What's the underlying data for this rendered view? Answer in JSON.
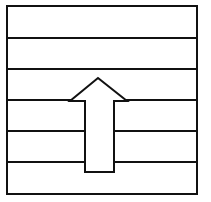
{
  "diagram": {
    "colors": {
      "stroke": "#111111",
      "fill": "#ffffff",
      "background": "#ffffff"
    },
    "frame": {
      "x": 7,
      "y": 6,
      "width": 190,
      "height": 188
    },
    "bands": [
      {
        "index": 1,
        "y_top": 6,
        "y_bottom": 38
      },
      {
        "index": 2,
        "y_top": 38,
        "y_bottom": 69
      },
      {
        "index": 3,
        "y_top": 69,
        "y_bottom": 100
      },
      {
        "index": 4,
        "y_top": 100,
        "y_bottom": 131
      },
      {
        "index": 5,
        "y_top": 131,
        "y_bottom": 162
      },
      {
        "index": 6,
        "y_top": 162,
        "y_bottom": 194
      }
    ],
    "arrow": {
      "direction": "up",
      "tip": [
        98,
        78
      ],
      "head_left": [
        70,
        101
      ],
      "head_right": [
        127,
        101
      ],
      "shaft_left_x": 85,
      "shaft_right_x": 114,
      "shaft_bottom_y": 172
    }
  }
}
